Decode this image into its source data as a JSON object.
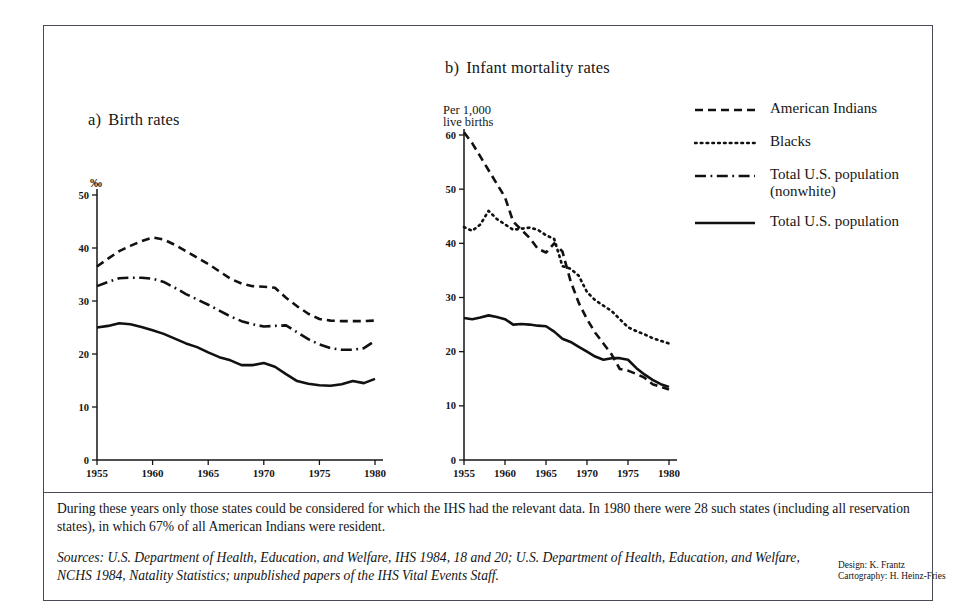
{
  "figure": {
    "panel_a": {
      "letter": "a)",
      "title": "Birth rates",
      "unit": "‰"
    },
    "panel_b": {
      "letter": "b)",
      "title": "Infant mortality rates",
      "unit_line1": "Per 1,000",
      "unit_line2": "live births"
    }
  },
  "legend": {
    "items": [
      {
        "label": "American Indians",
        "style": "dashed",
        "name": "legend-american-indians"
      },
      {
        "label": "Blacks",
        "style": "dotted",
        "name": "legend-blacks"
      },
      {
        "label": "Total U.S. population\n(nonwhite)",
        "style": "dash-dot",
        "name": "legend-total-us-nonwhite"
      },
      {
        "label": "Total U.S. population",
        "style": "solid",
        "name": "legend-total-us"
      }
    ]
  },
  "caption": {
    "note": "During these years only those states could be considered for which the IHS had the relevant data. In 1980 there were 28 such states (including all reservation states), in which 67% of all American Indians were resident.",
    "sources": "Sources: U.S. Department of Health, Education, and Welfare, IHS 1984, 18 and 20; U.S. Department of Health, Education, and Welfare, NCHS 1984, Natality Statistics; unpublished papers of the IHS Vital Events Staff.",
    "credit_design": "Design: K. Frantz",
    "credit_cartography": "Cartography: H. Heinz-Fries"
  },
  "chart_data": [
    {
      "type": "line",
      "id": "birth-rates",
      "title": "a)  Birth rates",
      "xlabel": "",
      "ylabel": "‰",
      "xlim": [
        1955,
        1980
      ],
      "ylim": [
        0,
        50
      ],
      "yticks": [
        0,
        10,
        20,
        30,
        40,
        50
      ],
      "xticks": [
        1955,
        1960,
        1965,
        1970,
        1975,
        1980
      ],
      "grid": false,
      "legend_position": "external-right",
      "x": [
        1955,
        1956,
        1957,
        1958,
        1959,
        1960,
        1961,
        1962,
        1963,
        1964,
        1965,
        1966,
        1967,
        1968,
        1969,
        1970,
        1971,
        1972,
        1973,
        1974,
        1975,
        1976,
        1977,
        1978,
        1979,
        1980
      ],
      "series": [
        {
          "name": "American Indians",
          "style": "dashed",
          "values": [
            36.5,
            38.0,
            39.4,
            40.4,
            41.3,
            42.0,
            41.6,
            40.6,
            39.4,
            38.2,
            37.0,
            35.6,
            34.2,
            33.3,
            32.8,
            32.7,
            32.5,
            30.6,
            29.0,
            27.6,
            26.6,
            26.3,
            26.2,
            26.2,
            26.2,
            26.3
          ]
        },
        {
          "name": "Total U.S. population (nonwhite)",
          "style": "dash-dot",
          "values": [
            32.8,
            33.6,
            34.3,
            34.4,
            34.4,
            34.2,
            33.6,
            32.5,
            31.3,
            30.3,
            29.3,
            28.2,
            27.1,
            26.2,
            25.6,
            25.2,
            25.3,
            25.4,
            24.1,
            22.8,
            21.8,
            21.1,
            20.8,
            20.8,
            21.1,
            22.5
          ]
        },
        {
          "name": "Total U.S. population",
          "style": "solid",
          "values": [
            25.0,
            25.3,
            25.8,
            25.6,
            25.1,
            24.5,
            23.8,
            22.9,
            22.0,
            21.3,
            20.3,
            19.4,
            18.8,
            17.9,
            17.9,
            18.3,
            17.6,
            16.2,
            14.9,
            14.4,
            14.1,
            14.0,
            14.3,
            14.9,
            14.5,
            15.3
          ]
        }
      ]
    },
    {
      "type": "line",
      "id": "infant-mortality-rates",
      "title": "b)  Infant mortality rates",
      "xlabel": "",
      "ylabel": "Per 1,000 live births",
      "xlim": [
        1955,
        1980
      ],
      "ylim": [
        0,
        60
      ],
      "yticks": [
        0,
        10,
        20,
        30,
        40,
        50,
        60
      ],
      "xticks": [
        1955,
        1960,
        1965,
        1970,
        1975,
        1980
      ],
      "grid": false,
      "legend_position": "external-right",
      "x": [
        1955,
        1956,
        1957,
        1958,
        1959,
        1960,
        1961,
        1962,
        1963,
        1964,
        1965,
        1966,
        1967,
        1968,
        1969,
        1970,
        1971,
        1972,
        1973,
        1974,
        1975,
        1976,
        1977,
        1978,
        1979,
        1980
      ],
      "series": [
        {
          "name": "American Indians",
          "style": "dashed",
          "values": [
            60.5,
            58.5,
            56.0,
            53.5,
            51.0,
            48.5,
            44.0,
            42.5,
            41.0,
            39.0,
            38.3,
            40.0,
            38.5,
            33.0,
            29.0,
            26.0,
            23.5,
            21.5,
            19.5,
            16.8,
            16.5,
            15.9,
            15.2,
            14.0,
            13.5,
            13.0
          ]
        },
        {
          "name": "Blacks",
          "style": "dotted",
          "values": [
            43.0,
            42.3,
            43.5,
            46.0,
            44.5,
            43.5,
            42.5,
            42.7,
            42.9,
            42.5,
            41.5,
            40.8,
            35.8,
            35.3,
            34.0,
            31.0,
            29.5,
            28.5,
            27.5,
            26.0,
            24.5,
            23.8,
            23.2,
            22.5,
            22.0,
            21.5
          ]
        },
        {
          "name": "Total U.S. population",
          "style": "solid",
          "values": [
            26.2,
            26.0,
            26.3,
            26.7,
            26.4,
            26.0,
            25.0,
            25.1,
            25.0,
            24.8,
            24.7,
            23.7,
            22.4,
            21.8,
            20.9,
            20.0,
            19.1,
            18.5,
            18.8,
            18.8,
            18.5,
            17.0,
            15.8,
            14.8,
            14.0,
            13.5
          ]
        }
      ]
    }
  ]
}
